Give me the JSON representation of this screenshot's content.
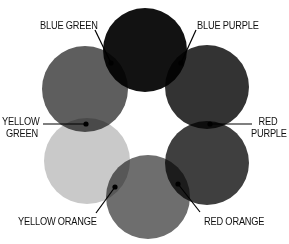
{
  "diagram": {
    "title": "",
    "type": "color-wheel",
    "circles": [
      {
        "id": "blue",
        "cx": 145,
        "cy": 50,
        "r": 42,
        "fill": "#121212"
      },
      {
        "id": "purple",
        "cx": 207,
        "cy": 87,
        "r": 42,
        "fill": "#333333"
      },
      {
        "id": "red",
        "cx": 207,
        "cy": 163,
        "r": 42,
        "fill": "#3f3f3f"
      },
      {
        "id": "orange",
        "cx": 148,
        "cy": 197,
        "r": 42,
        "fill": "#6e6e6e"
      },
      {
        "id": "yellow",
        "cx": 87,
        "cy": 161,
        "r": 43,
        "fill": "#c9c9c9"
      },
      {
        "id": "green",
        "cx": 85,
        "cy": 89,
        "r": 43,
        "fill": "#5e5e5e"
      }
    ],
    "labels": {
      "blue_green": "BLUE GREEN",
      "blue_purple": "BLUE PURPLE",
      "red_purple_line1": "RED",
      "red_purple_line2": "PURPLE",
      "red_orange": "RED ORANGE",
      "yellow_orange": "YELLOW ORANGE",
      "yellow_green_line1": "YELLOW",
      "yellow_green_line2": "GREEN"
    },
    "callouts": [
      {
        "name": "blue-green",
        "dot": [
          111,
          63
        ],
        "line_to": [
          95,
          30
        ]
      },
      {
        "name": "blue-purple",
        "dot": [
          181,
          63
        ],
        "line_to": [
          196,
          30
        ]
      },
      {
        "name": "red-purple",
        "dot": [
          210,
          124
        ],
        "line_to": [
          252,
          124
        ]
      },
      {
        "name": "red-orange",
        "dot": [
          178,
          184
        ],
        "line_to": [
          200,
          212
        ]
      },
      {
        "name": "yellow-orange",
        "dot": [
          115,
          187
        ],
        "line_to": [
          96,
          213
        ]
      },
      {
        "name": "yellow-green",
        "dot": [
          86,
          124
        ],
        "line_to": [
          43,
          124
        ]
      }
    ]
  }
}
